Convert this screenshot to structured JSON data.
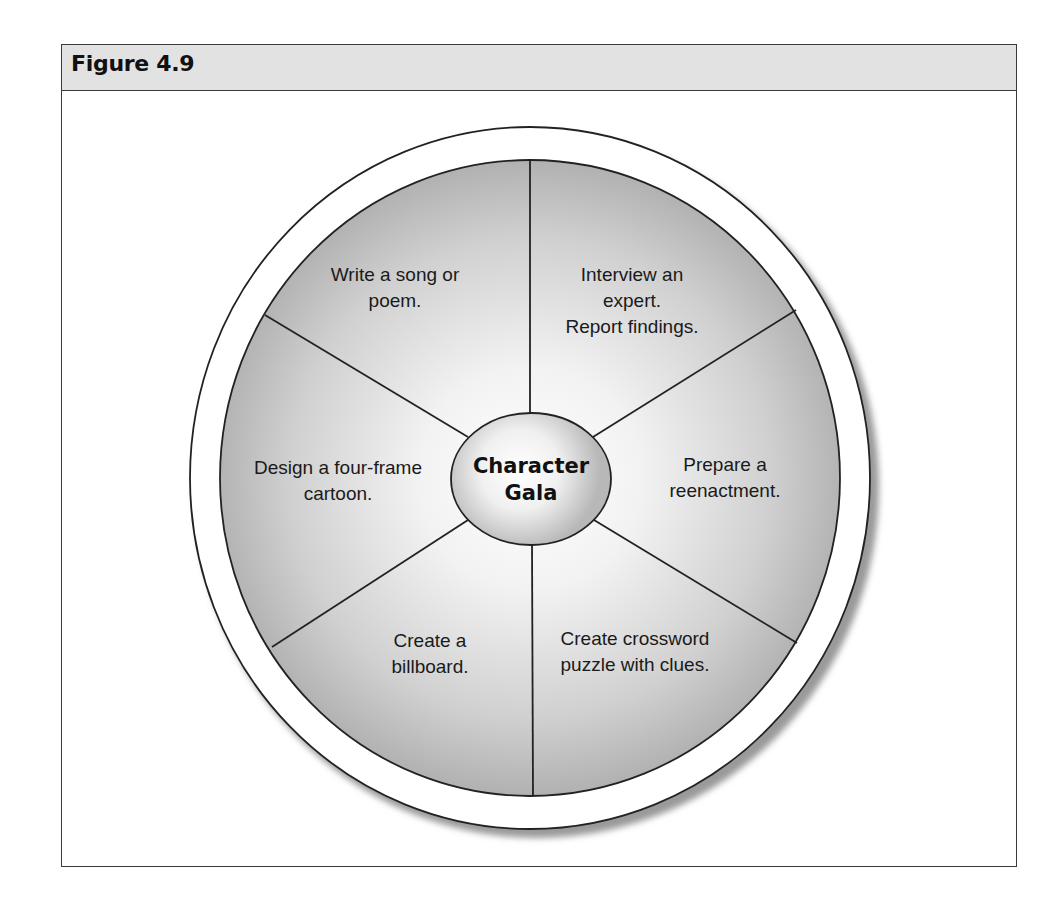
{
  "figure": {
    "title": "Figure 4.9"
  },
  "diagram": {
    "type": "wheel",
    "center": {
      "line1": "Character",
      "line2": "Gala"
    },
    "segments": [
      {
        "position": "top-left",
        "lines": [
          "Write a song or",
          "poem."
        ]
      },
      {
        "position": "top-right",
        "lines": [
          "Interview an",
          "expert.",
          "Report findings."
        ]
      },
      {
        "position": "right",
        "lines": [
          "Prepare a",
          "reenactment."
        ]
      },
      {
        "position": "bottom-right",
        "lines": [
          "Create crossword",
          "puzzle with clues."
        ]
      },
      {
        "position": "bottom-left",
        "lines": [
          "Create a",
          "billboard."
        ]
      },
      {
        "position": "left",
        "lines": [
          "Design a four-frame",
          "cartoon."
        ]
      }
    ],
    "colors": {
      "wedge_light": "#ffffff",
      "wedge_dark": "#b5b5b5",
      "line": "#222222",
      "title_bar": "#e2e2e2"
    }
  }
}
